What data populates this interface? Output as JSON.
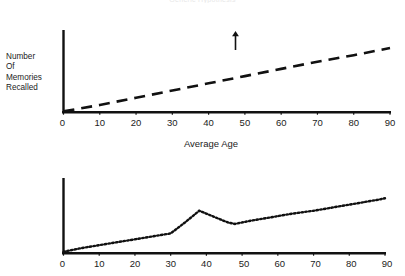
{
  "figure": {
    "title": "Generic Hypothesis",
    "background": "#ffffff",
    "ink_color": "#111111"
  },
  "chart_data": [
    {
      "type": "line",
      "id": "top-chart",
      "title": "",
      "xlabel": "Average Age",
      "ylabel": "Number Of Memories Recalled",
      "ylabel_lines": [
        "Number",
        "Of",
        "Memories",
        "Recalled"
      ],
      "y_axis_arrow": true,
      "y_axis_ticks_shown": false,
      "grid": false,
      "legend": false,
      "line_style": "dashed",
      "xlim": [
        0,
        90
      ],
      "ylim": [
        0,
        100
      ],
      "xticks": [
        0,
        10,
        20,
        30,
        40,
        50,
        60,
        70,
        80,
        90
      ],
      "xtick_labels": [
        "0",
        "10",
        "20",
        "30",
        "40",
        "50",
        "60",
        "70",
        "80",
        "90"
      ],
      "x": [
        0,
        10,
        20,
        30,
        40,
        50,
        60,
        70,
        80,
        90
      ],
      "values": [
        1,
        9,
        18,
        27,
        36,
        45,
        54,
        63,
        71,
        80
      ]
    },
    {
      "type": "line",
      "id": "bottom-chart",
      "title": "",
      "xlabel": "",
      "ylabel": "",
      "y_axis_arrow": false,
      "y_axis_ticks_shown": false,
      "grid": false,
      "legend": false,
      "line_style": "dotted",
      "xlim": [
        0,
        90
      ],
      "ylim": [
        0,
        100
      ],
      "xticks": [
        0,
        10,
        20,
        30,
        40,
        50,
        60,
        70,
        80,
        90
      ],
      "xtick_labels": [
        "0",
        "10",
        "20",
        "30",
        "40",
        "50",
        "60",
        "70",
        "80",
        "90"
      ],
      "x": [
        0,
        5,
        10,
        15,
        20,
        25,
        30,
        34,
        38,
        42,
        46,
        48,
        52,
        58,
        64,
        70,
        76,
        82,
        88,
        90
      ],
      "values": [
        2,
        7,
        11,
        15,
        19,
        23,
        27,
        42,
        58,
        50,
        42,
        40,
        44,
        49,
        54,
        58,
        63,
        68,
        73,
        75
      ]
    }
  ]
}
